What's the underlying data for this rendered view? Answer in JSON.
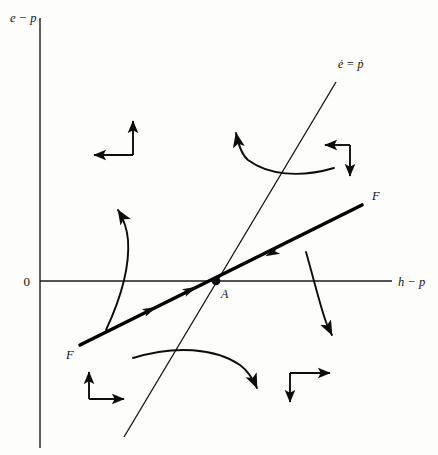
{
  "figure": {
    "type": "phase-diagram",
    "background_color": "#fdfdfb",
    "ink_color": "#0d0d0d",
    "axes": {
      "y_label": "e − p",
      "x_label": "h − p",
      "origin_label": "0",
      "y_axis_x_px": 40,
      "x_axis_y_px": 281,
      "y_axis_top_px": 18,
      "y_axis_bottom_px": 448,
      "x_axis_left_px": 40,
      "x_axis_right_px": 392
    },
    "curves": [
      {
        "name": "ee-dot-schedule",
        "label": "ė = ṗ",
        "label_plain": "e-dot = p-dot",
        "label_x_px": 338,
        "label_y_px": 68,
        "slope": "steep-positive",
        "start_px": [
          124,
          437
        ],
        "end_px": [
          336,
          82
        ]
      },
      {
        "name": "ff-saddle-path",
        "label_right": "F",
        "label_left": "F",
        "label_right_x_px": 372,
        "label_right_y_px": 196,
        "label_left_x_px": 66,
        "label_left_y_px": 355,
        "slope": "shallow-positive",
        "start_px": [
          80,
          345
        ],
        "end_px": [
          362,
          205
        ],
        "arrow_direction": "toward-equilibrium"
      }
    ],
    "points": [
      {
        "name": "equilibrium-point",
        "label": "A",
        "x_px": 216,
        "y_px": 281,
        "marker": "filled-dot"
      }
    ],
    "quadrant_arrow_pairs": [
      {
        "name": "arrow-pair-top-left",
        "horizontal": "left",
        "vertical": "up",
        "corner_x_px": 133,
        "corner_y_px": 155
      },
      {
        "name": "arrow-pair-top-right",
        "horizontal": "left",
        "vertical": "down",
        "corner_x_px": 350,
        "corner_y_px": 145
      },
      {
        "name": "arrow-pair-bottom-left",
        "horizontal": "right",
        "vertical": "up",
        "corner_x_px": 89,
        "corner_y_px": 399
      },
      {
        "name": "arrow-pair-bottom-right",
        "horizontal": "right",
        "vertical": "down",
        "corner_x_px": 290,
        "corner_y_px": 373
      }
    ],
    "trajectory_arcs": [
      {
        "name": "trajectory-arc-upper",
        "direction": "up-left",
        "arrowhead_x_px": 236,
        "arrowhead_y_px": 129
      },
      {
        "name": "trajectory-arc-left",
        "direction": "up",
        "arrowhead_x_px": 117,
        "arrowhead_y_px": 212
      },
      {
        "name": "trajectory-arc-right",
        "direction": "down",
        "arrowhead_x_px": 330,
        "arrowhead_y_px": 333
      },
      {
        "name": "trajectory-arc-lower",
        "direction": "down-right",
        "arrowhead_x_px": 256,
        "arrowhead_y_px": 387
      }
    ]
  }
}
